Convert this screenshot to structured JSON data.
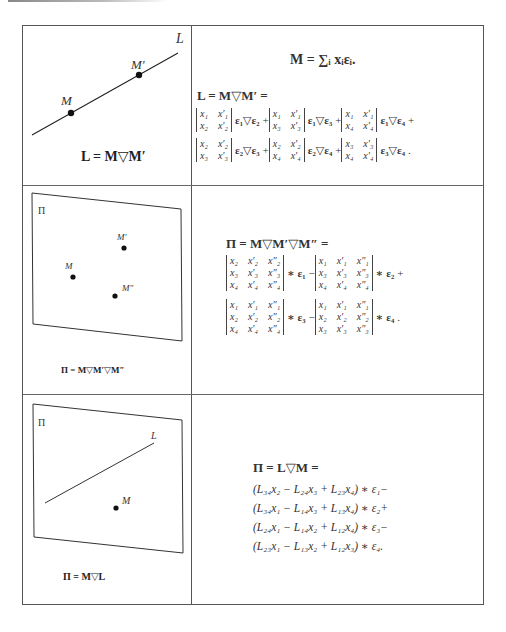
{
  "rows": [
    {
      "figure": {
        "line_label": "L",
        "point_labels": [
          "M",
          "M′"
        ],
        "caption": "L = M▽M′"
      },
      "equations": {
        "sum_def": "M = ∑ᵢ xᵢεᵢ.",
        "lhs": "L = M▽M′ =",
        "terms": [
          {
            "det": [
              [
                "x₁",
                "x′₁"
              ],
              [
                "x₂",
                "x′₂"
              ]
            ],
            "basis": "ε₁▽ε₂",
            "op": "+"
          },
          {
            "det": [
              [
                "x₁",
                "x′₁"
              ],
              [
                "x₃",
                "x′₃"
              ]
            ],
            "basis": "ε₁▽ε₃",
            "op": "+"
          },
          {
            "det": [
              [
                "x₁",
                "x′₁"
              ],
              [
                "x₄",
                "x′₄"
              ]
            ],
            "basis": "ε₁▽ε₄",
            "op": "+"
          },
          {
            "det": [
              [
                "x₂",
                "x′₂"
              ],
              [
                "x₃",
                "x′₃"
              ]
            ],
            "basis": "ε₂▽ε₃",
            "op": "+"
          },
          {
            "det": [
              [
                "x₂",
                "x′₂"
              ],
              [
                "x₄",
                "x′₄"
              ]
            ],
            "basis": "ε₂▽ε₄",
            "op": "+"
          },
          {
            "det": [
              [
                "x₃",
                "x′₃"
              ],
              [
                "x₄",
                "x′₄"
              ]
            ],
            "basis": "ε₃▽ε₄",
            "op": "."
          }
        ]
      }
    },
    {
      "figure": {
        "plane_label": "Π",
        "point_labels": [
          "M",
          "M′",
          "M″"
        ],
        "caption": "Π = M▽M′▽M″"
      },
      "equations": {
        "lhs": "Π = M▽M′▽M″ =",
        "terms": [
          {
            "det": [
              [
                "x₂",
                "x′₂",
                "x″₂"
              ],
              [
                "x₃",
                "x′₃",
                "x″₃"
              ],
              [
                "x₄",
                "x′₄",
                "x″₄"
              ]
            ],
            "basis": "∗ ε₁",
            "op": "−"
          },
          {
            "det": [
              [
                "x₁",
                "x′₁",
                "x″₁"
              ],
              [
                "x₃",
                "x′₃",
                "x″₃"
              ],
              [
                "x₄",
                "x′₄",
                "x″₄"
              ]
            ],
            "basis": "∗ ε₂",
            "op": "+"
          },
          {
            "det": [
              [
                "x₁",
                "x′₁",
                "x″₁"
              ],
              [
                "x₂",
                "x′₂",
                "x″₂"
              ],
              [
                "x₄",
                "x′₄",
                "x″₄"
              ]
            ],
            "basis": "∗ ε₃",
            "op": "−"
          },
          {
            "det": [
              [
                "x₁",
                "x′₁",
                "x″₁"
              ],
              [
                "x₂",
                "x′₂",
                "x″₂"
              ],
              [
                "x₃",
                "x′₃",
                "x″₃"
              ]
            ],
            "basis": "∗ ε₄",
            "op": "."
          }
        ]
      }
    },
    {
      "figure": {
        "plane_label": "Π",
        "line_label": "L",
        "point_labels": [
          "M"
        ],
        "caption": "Π = M▽L"
      },
      "equations": {
        "lhs": "Π = L▽M =",
        "lines": [
          "(L₃₄x₂ − L₂₄x₃ + L₂₃x₄) ∗ ε₁−",
          "(L₃₄x₁ − L₁₄x₃ + L₁₃x₄) ∗ ε₂+",
          "(L₂₄x₁ − L₁₄x₂ + L₁₂x₄) ∗ ε₃−",
          "(L₂₃x₁ − L₁₃x₂ + L₁₂x₃) ∗ ε₄."
        ]
      }
    }
  ]
}
